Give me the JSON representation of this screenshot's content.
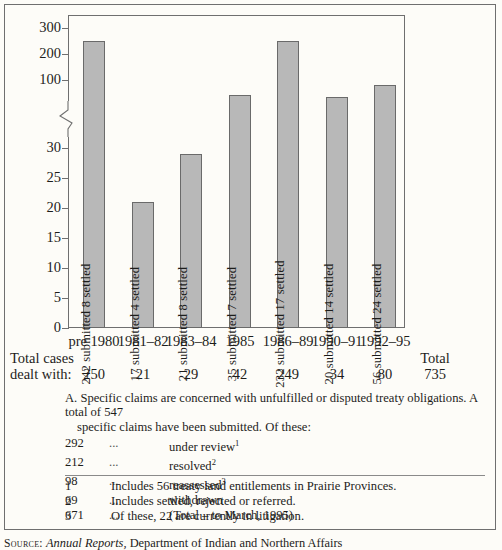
{
  "chart_data": {
    "type": "bar",
    "title": "",
    "xlabel": "",
    "ylabel": "",
    "categories": [
      "pre 1980",
      "1981–82",
      "1983–84",
      "1985",
      "1986–89",
      "1990–91",
      "1992–95"
    ],
    "values": [
      250,
      21,
      29,
      42,
      249,
      34,
      80
    ],
    "bar_labels": [
      "242 submitted  8 settled",
      "17 submitted  4 settled",
      "21 submitted  8 settled",
      "35 submitted  7 settled",
      "232 submitted  17 settled",
      "20 submitted  14 settled",
      "56 submitted  24 settled"
    ],
    "submitted": [
      242,
      17,
      21,
      35,
      232,
      20,
      56
    ],
    "settled": [
      8,
      4,
      8,
      7,
      17,
      14,
      24
    ],
    "y_ticks_lower": [
      0,
      5,
      10,
      15,
      20,
      25,
      30
    ],
    "y_ticks_upper": [
      100,
      200,
      300
    ],
    "broken_axis": true,
    "grid": false,
    "legend": "none",
    "bar_color": "#b8b8b8",
    "bar_border_color": "#6a6a6a"
  },
  "totals": {
    "caption_line1": "Total cases",
    "caption_line2": "dealt with:",
    "values": [
      "250",
      "21",
      "29",
      "42",
      "249",
      "34",
      "80"
    ],
    "grand_total_label": "Total",
    "grand_total_value": "735"
  },
  "note": {
    "paragraph_line1": "A. Specific claims are concerned with unfulfilled or disputed treaty obligations. A total of 547",
    "paragraph_line2": "specific claims have been submitted. Of these:",
    "dots": "...",
    "rows": [
      {
        "count": "292",
        "desc": "under review",
        "sup": "1"
      },
      {
        "count": "212",
        "desc": "resolved",
        "sup": "2"
      },
      {
        "count": "98",
        "desc": "reassessed",
        "sup": "3"
      },
      {
        "count": "69",
        "desc": "withdrawn",
        "sup": ""
      },
      {
        "count": "671",
        "desc": "(Total – to March, 1995)",
        "sup": ""
      }
    ]
  },
  "footnotes": [
    {
      "num": "1",
      "text": "Includes 56 treaty land entitlements in Prairie Provinces."
    },
    {
      "num": "2",
      "text": "Includes settled, rejected or referred."
    },
    {
      "num": "3",
      "text": "Of these, 22 are currently in litigation."
    }
  ],
  "source": {
    "kicker": "Source:",
    "italic": "Annual Reports,",
    "rest": " Department of Indian and Northern Affairs"
  }
}
